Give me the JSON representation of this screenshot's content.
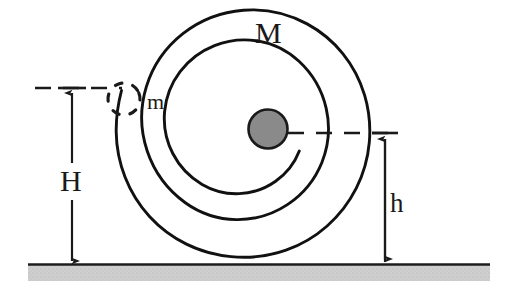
{
  "figure": {
    "width": 516,
    "height": 302,
    "background_color": "#ffffff"
  },
  "labels": {
    "spiral_mass": "M",
    "point_mass": "m",
    "height_total": "H",
    "height_center": "h"
  },
  "colors": {
    "ink": "#1a1a1a",
    "stroke": "#111111",
    "center_mass_fill": "#8a8a8a",
    "center_mass_stroke": "#1a1a1a",
    "ground_line": "#1c1c1c",
    "ground_hatch": "#c9c9c9",
    "dashed": "#1a1a1a"
  },
  "geometry": {
    "ground_y": 264,
    "ground_x_start": 28,
    "ground_x_end": 490,
    "ground_band_height": 16,
    "spiral_center_x": 268,
    "spiral_center_y": 133,
    "spiral_turns": 2.05,
    "spiral_outer_radius": 131,
    "spiral_inner_radius": 16,
    "center_mass_radius": 20,
    "point_mass_x": 122,
    "point_mass_y": 99,
    "point_mass_radius": 17
  },
  "dimensions": {
    "H": {
      "label": "H",
      "axis_x": 72,
      "top_y": 88,
      "bottom_y": 264,
      "description": "height of point mass m above the ground"
    },
    "h": {
      "label": "h",
      "axis_x": 385,
      "top_y": 133,
      "bottom_y": 262,
      "description": "height of the spiral centre above the ground"
    }
  },
  "guides": {
    "top_dashed": {
      "x1": 35,
      "x2": 122,
      "y": 88
    },
    "center_dashed": {
      "x1": 288,
      "x2": 400,
      "y": 133
    }
  }
}
